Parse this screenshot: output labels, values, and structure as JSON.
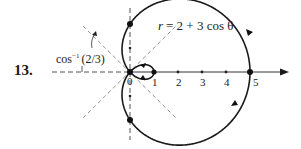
{
  "problem": {
    "number": "13."
  },
  "equation": {
    "lhs": "r",
    "rhs": "= 2 + 3 cos θ"
  },
  "angle_label": {
    "text": "cos",
    "superscript": "−1",
    "argument": "(2/3)"
  },
  "axis": {
    "origin_label": "0",
    "tick_labels": [
      "1",
      "2",
      "3",
      "4",
      "5"
    ]
  },
  "colors": {
    "ink": "#1a1a1a",
    "dashed": "#555555",
    "axis": "#333333",
    "background": "#ffffff"
  },
  "geometry": {
    "pole_x": 130,
    "pole_y": 72,
    "scale_px_per_unit": 24
  },
  "curve": {
    "type": "limaçon with inner loop",
    "a": 2,
    "b": 3,
    "max_r": 5,
    "inner_loop_min_r": -1
  }
}
